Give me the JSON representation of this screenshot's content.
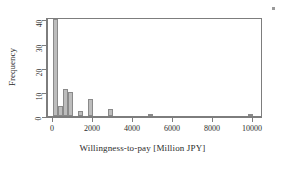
{
  "chart_data": {
    "type": "bar",
    "title": "",
    "subtitle": "",
    "xlabel": "Willingness-to-pay  [Million JPY]",
    "ylabel": "Frequency",
    "xlim": [
      -250,
      10500
    ],
    "ylim": [
      0,
      41
    ],
    "xticks": [
      0,
      2000,
      4000,
      6000,
      8000,
      10000
    ],
    "xtick_labels": [
      "0",
      "2000",
      "4000",
      "6000",
      "8000",
      "10000"
    ],
    "yticks": [
      0,
      10,
      20,
      30,
      40
    ],
    "ytick_labels": [
      "0",
      "10",
      "20",
      "30",
      "40"
    ],
    "grid": false,
    "legend": null,
    "bin_width": 250,
    "bar_color": "#bdbdbd",
    "bar_edge_color": "#8a8a8a",
    "bins": [
      {
        "bin_start": 0,
        "bin_end": 250,
        "center": 125,
        "value": 40
      },
      {
        "bin_start": 250,
        "bin_end": 500,
        "center": 375,
        "value": 4
      },
      {
        "bin_start": 500,
        "bin_end": 750,
        "center": 625,
        "value": 11
      },
      {
        "bin_start": 750,
        "bin_end": 1000,
        "center": 875,
        "value": 10
      },
      {
        "bin_start": 1000,
        "bin_end": 1250,
        "center": 1125,
        "value": 0
      },
      {
        "bin_start": 1250,
        "bin_end": 1500,
        "center": 1375,
        "value": 2
      },
      {
        "bin_start": 1500,
        "bin_end": 1750,
        "center": 1625,
        "value": 0
      },
      {
        "bin_start": 1750,
        "bin_end": 2000,
        "center": 1875,
        "value": 7
      },
      {
        "bin_start": 2000,
        "bin_end": 2250,
        "center": 2125,
        "value": 0
      },
      {
        "bin_start": 2250,
        "bin_end": 2500,
        "center": 2375,
        "value": 0
      },
      {
        "bin_start": 2500,
        "bin_end": 2750,
        "center": 2625,
        "value": 0
      },
      {
        "bin_start": 2750,
        "bin_end": 3000,
        "center": 2875,
        "value": 3
      },
      {
        "bin_start": 4750,
        "bin_end": 5000,
        "center": 4875,
        "value": 1
      },
      {
        "bin_start": 9750,
        "bin_end": 10000,
        "center": 9875,
        "value": 1
      }
    ],
    "categories": [
      125,
      375,
      625,
      875,
      1125,
      1375,
      1625,
      1875,
      2125,
      2375,
      2625,
      2875,
      4875,
      9875
    ],
    "values": [
      40,
      4,
      11,
      10,
      0,
      2,
      0,
      7,
      0,
      0,
      0,
      3,
      1,
      1
    ]
  },
  "annotations": {
    "corner_mark": "small-square-artifact"
  }
}
